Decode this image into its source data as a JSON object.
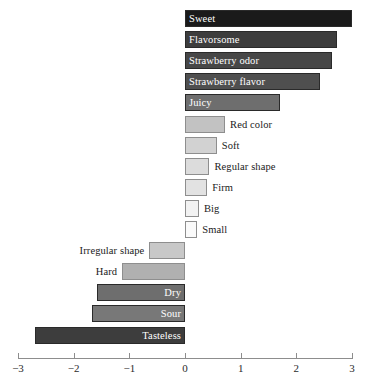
{
  "chart_data": {
    "type": "bar",
    "orientation": "horizontal",
    "title": "",
    "subtitle": "",
    "xlabel": "",
    "ylabel": "",
    "xlim": [
      -3,
      3
    ],
    "grid": false,
    "legend": "none",
    "axis": {
      "ticks": [
        -3,
        -2,
        -1,
        0,
        1,
        2,
        3
      ],
      "tick_labels": [
        "−3",
        "−2",
        "−1",
        "0",
        "1",
        "2",
        "3"
      ]
    },
    "categories": [
      "Sweet",
      "Flavorsome",
      "Strawberry odor",
      "Strawberry flavor",
      "Juicy",
      "Red color",
      "Soft",
      "Regular shape",
      "Firm",
      "Big",
      "Small",
      "Irregular shape",
      "Hard",
      "Dry",
      "Sour",
      "Tasteless"
    ],
    "values": [
      3.0,
      2.73,
      2.64,
      2.42,
      1.71,
      0.72,
      0.57,
      0.44,
      0.4,
      0.25,
      0.22,
      -0.64,
      -1.13,
      -1.58,
      -1.67,
      -2.7
    ],
    "bars": [
      {
        "label": "Sweet",
        "value": 3.0,
        "color": "#1a1a1a",
        "label_inside": true,
        "label_color": "#ffffff"
      },
      {
        "label": "Flavorsome",
        "value": 2.73,
        "color": "#3d3d3d",
        "label_inside": true,
        "label_color": "#ffffff"
      },
      {
        "label": "Strawberry odor",
        "value": 2.64,
        "color": "#474747",
        "label_inside": true,
        "label_color": "#ffffff"
      },
      {
        "label": "Strawberry flavor",
        "value": 2.42,
        "color": "#4f4f4f",
        "label_inside": true,
        "label_color": "#ffffff"
      },
      {
        "label": "Juicy",
        "value": 1.71,
        "color": "#6e6e6e",
        "label_inside": true,
        "label_color": "#ffffff"
      },
      {
        "label": "Red color",
        "value": 0.72,
        "color": "#c2c2c2",
        "label_inside": false,
        "label_color": "#1a1a1a"
      },
      {
        "label": "Soft",
        "value": 0.57,
        "color": "#d2d2d2",
        "label_inside": false,
        "label_color": "#1a1a1a"
      },
      {
        "label": "Regular shape",
        "value": 0.44,
        "color": "#dcdcdc",
        "label_inside": false,
        "label_color": "#1a1a1a"
      },
      {
        "label": "Firm",
        "value": 0.4,
        "color": "#e2e2e2",
        "label_inside": false,
        "label_color": "#1a1a1a"
      },
      {
        "label": "Big",
        "value": 0.25,
        "color": "#f2f2f2",
        "label_inside": false,
        "label_color": "#1a1a1a"
      },
      {
        "label": "Small",
        "value": 0.22,
        "color": "#fafafa",
        "label_inside": false,
        "label_color": "#1a1a1a"
      },
      {
        "label": "Irregular shape",
        "value": -0.64,
        "color": "#c8c8c8",
        "label_inside": false,
        "label_color": "#1a1a1a"
      },
      {
        "label": "Hard",
        "value": -1.13,
        "color": "#b0b0b0",
        "label_inside": false,
        "label_color": "#1a1a1a"
      },
      {
        "label": "Dry",
        "value": -1.58,
        "color": "#6e6e6e",
        "label_inside": true,
        "label_color": "#ffffff"
      },
      {
        "label": "Sour",
        "value": -1.67,
        "color": "#787878",
        "label_inside": true,
        "label_color": "#ffffff"
      },
      {
        "label": "Tasteless",
        "value": -2.7,
        "color": "#3d3d3d",
        "label_inside": true,
        "label_color": "#ffffff"
      }
    ]
  },
  "colors": {
    "background": "#ffffff",
    "axis": "#8d8d8d",
    "text": "#1a1a1a",
    "bar_border": "#8e8e8e"
  }
}
